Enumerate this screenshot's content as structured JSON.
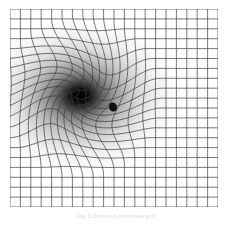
{
  "figure": {
    "title": "",
    "caption": "Fig. 1  Distorted coordinate grid",
    "background_color": "#ffffff",
    "grid_line_color": "#3a3a3a",
    "shading_color": "#000000",
    "body_color": "#111111"
  },
  "chart_data": {
    "type": "heatmap",
    "title": "",
    "subtitle": "",
    "xlabel": "",
    "ylabel": "",
    "legend": [],
    "grid": true,
    "plot_box": {
      "x": 10,
      "y": 9,
      "width": 208,
      "height": 198
    },
    "grid_spec": {
      "columns": 20,
      "rows": 20,
      "line_width": 0.7,
      "color": "#3a3a3a"
    },
    "x": [
      0,
      1,
      2,
      3,
      4,
      5,
      6,
      7,
      8,
      9,
      10,
      11,
      12,
      13,
      14,
      15,
      16,
      17,
      18,
      19,
      20
    ],
    "y": [
      0,
      1,
      2,
      3,
      4,
      5,
      6,
      7,
      8,
      9,
      10,
      11,
      12,
      13,
      14,
      15,
      16,
      17,
      18,
      19,
      20
    ],
    "xlim": [
      0,
      20
    ],
    "ylim": [
      0,
      20
    ],
    "distortion": {
      "model": "spiral-vortex",
      "center_px": [
        80,
        96
      ],
      "center_grid": [
        6.7,
        8.4
      ],
      "swirl_strength": 2.05,
      "radial_pull": 0.62,
      "core_radius_px": 11,
      "falloff_radius_px": 82
    },
    "shading": {
      "type": "radial-darkening",
      "center_px": [
        80,
        96
      ],
      "inner_value": 0.0,
      "outer_value": 1.0,
      "inner_radius_px": 9,
      "outer_radius_px": 78,
      "elongation_x": 1.28,
      "elongation_y": 1.0
    },
    "markers": [
      {
        "name": "compact-body",
        "center_px": [
          113,
          107
        ],
        "radius_px": 4.0,
        "color": "#111111",
        "label": ""
      }
    ]
  }
}
